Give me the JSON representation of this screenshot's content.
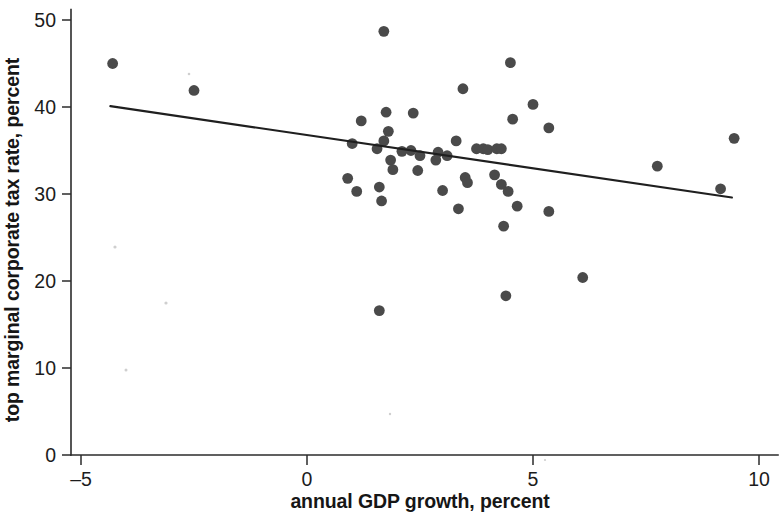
{
  "figure": {
    "background_color": "#ffffff",
    "point_color": "#4a4a4a",
    "line_color": "#1f1f1f",
    "axis_color": "#2b2b2b"
  },
  "chart_data": {
    "type": "scatter",
    "title": "",
    "xlabel": "annual GDP growth, percent",
    "ylabel": "top marginal corporate tax rate, percent",
    "xlim": [
      -5.5,
      10.2
    ],
    "ylim": [
      0,
      51
    ],
    "xticks": [
      -5,
      0,
      5,
      10
    ],
    "xtick_labels": [
      "–5",
      "0",
      "5",
      "10"
    ],
    "yticks": [
      0,
      10,
      20,
      30,
      40,
      50
    ],
    "ytick_labels": [
      "0",
      "10",
      "20",
      "30",
      "40",
      "50"
    ],
    "grid": false,
    "legend": "none",
    "points": [
      {
        "x": -4.3,
        "y": 45.0
      },
      {
        "x": -2.5,
        "y": 41.9
      },
      {
        "x": 1.2,
        "y": 38.4
      },
      {
        "x": 1.0,
        "y": 35.8
      },
      {
        "x": 0.9,
        "y": 31.8
      },
      {
        "x": 1.1,
        "y": 30.3
      },
      {
        "x": 1.6,
        "y": 16.6
      },
      {
        "x": 1.7,
        "y": 48.7
      },
      {
        "x": 1.75,
        "y": 39.4
      },
      {
        "x": 1.8,
        "y": 37.2
      },
      {
        "x": 1.7,
        "y": 36.1
      },
      {
        "x": 1.55,
        "y": 35.2
      },
      {
        "x": 1.85,
        "y": 33.9
      },
      {
        "x": 1.9,
        "y": 32.8
      },
      {
        "x": 1.6,
        "y": 30.8
      },
      {
        "x": 1.65,
        "y": 29.2
      },
      {
        "x": 2.1,
        "y": 34.9
      },
      {
        "x": 2.3,
        "y": 35.0
      },
      {
        "x": 2.35,
        "y": 39.3
      },
      {
        "x": 2.5,
        "y": 34.4
      },
      {
        "x": 2.45,
        "y": 32.7
      },
      {
        "x": 2.9,
        "y": 34.8
      },
      {
        "x": 2.85,
        "y": 33.9
      },
      {
        "x": 3.0,
        "y": 30.4
      },
      {
        "x": 3.1,
        "y": 34.4
      },
      {
        "x": 3.3,
        "y": 36.1
      },
      {
        "x": 3.45,
        "y": 42.1
      },
      {
        "x": 3.5,
        "y": 31.9
      },
      {
        "x": 3.55,
        "y": 31.3
      },
      {
        "x": 3.35,
        "y": 28.3
      },
      {
        "x": 3.75,
        "y": 35.2
      },
      {
        "x": 3.9,
        "y": 35.2
      },
      {
        "x": 4.0,
        "y": 35.1
      },
      {
        "x": 4.2,
        "y": 35.2
      },
      {
        "x": 4.3,
        "y": 35.2
      },
      {
        "x": 4.15,
        "y": 32.2
      },
      {
        "x": 4.3,
        "y": 31.1
      },
      {
        "x": 4.4,
        "y": 18.3
      },
      {
        "x": 4.35,
        "y": 26.3
      },
      {
        "x": 4.5,
        "y": 45.1
      },
      {
        "x": 4.55,
        "y": 38.6
      },
      {
        "x": 4.45,
        "y": 30.3
      },
      {
        "x": 4.65,
        "y": 28.6
      },
      {
        "x": 5.0,
        "y": 40.3
      },
      {
        "x": 5.35,
        "y": 37.6
      },
      {
        "x": 5.35,
        "y": 28.0
      },
      {
        "x": 6.1,
        "y": 20.4
      },
      {
        "x": 7.75,
        "y": 33.2
      },
      {
        "x": 9.15,
        "y": 30.6
      },
      {
        "x": 9.45,
        "y": 36.4
      }
    ],
    "trend_line": {
      "x_start": -4.35,
      "y_start": 40.1,
      "x_end": 9.4,
      "y_end": 29.6
    }
  }
}
